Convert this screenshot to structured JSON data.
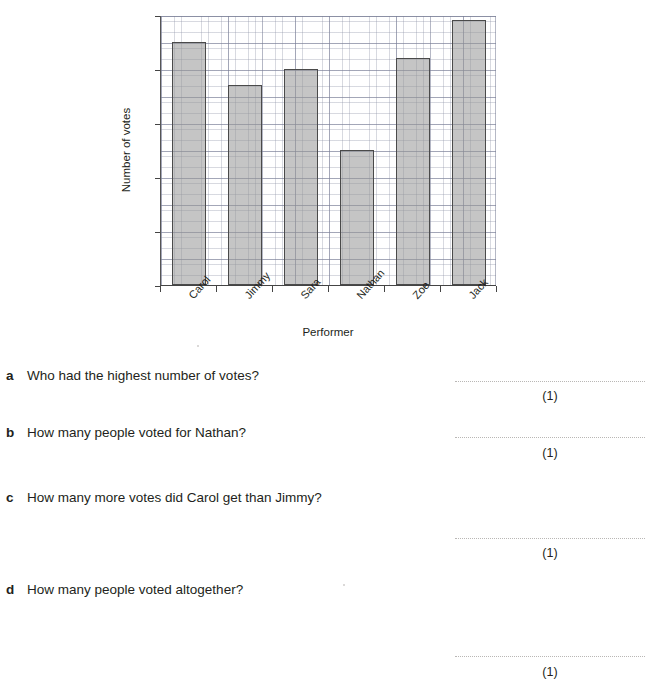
{
  "chart_data": {
    "type": "bar",
    "title": "",
    "xlabel": "Performer",
    "ylabel": "Number of votes",
    "categories": [
      "Carol",
      "Jimmy",
      "Sara",
      "Nathan",
      "Zoe",
      "Jack"
    ],
    "values": [
      45,
      37,
      40,
      25,
      42,
      49
    ],
    "ylim": [
      0,
      50
    ],
    "y_ticks": [
      0,
      10,
      20,
      30,
      40,
      50
    ],
    "y_tick_labels": [
      "0",
      "10",
      "20",
      "30",
      "40",
      "50"
    ],
    "y_minor_step": 1,
    "y_major_gridline_step": 5,
    "grid": true,
    "legend": "none",
    "bar_fill": "#969696",
    "bar_edge": "#4a4a4a",
    "grid_color": "#787d96"
  },
  "questions": [
    {
      "letter": "a",
      "text": "Who had the highest number of votes?",
      "marks": "(1)"
    },
    {
      "letter": "b",
      "text": "How many people voted for Nathan?",
      "marks": "(1)"
    },
    {
      "letter": "c",
      "text": "How many more votes did Carol get than Jimmy?",
      "marks": "(1)"
    },
    {
      "letter": "d",
      "text": "How many people voted altogether?",
      "marks": "(1)"
    }
  ]
}
